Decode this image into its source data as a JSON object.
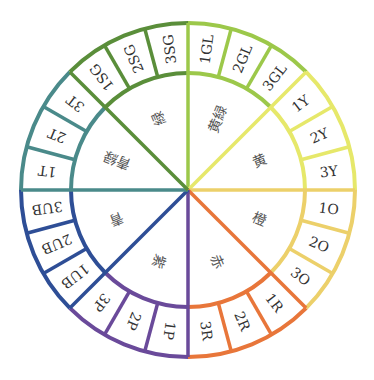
{
  "diagram": {
    "title": "",
    "center": [
      188,
      190
    ],
    "outer_radius": 167,
    "inner_radius": 117,
    "groups": [
      {
        "name": "黄緑",
        "color": "#9cc84a",
        "segments": [
          "1GL",
          "2GL",
          "3GL"
        ]
      },
      {
        "name": "黄",
        "color": "#e6e86a",
        "segments": [
          "1Y",
          "2Y",
          "3Y"
        ]
      },
      {
        "name": "橙",
        "color": "#ecd06a",
        "segments": [
          "1O",
          "2O",
          "3O"
        ]
      },
      {
        "name": "赤",
        "color": "#e8763a",
        "segments": [
          "1R",
          "2R",
          "3R"
        ]
      },
      {
        "name": "紫",
        "color": "#6a4a9a",
        "segments": [
          "1P",
          "2P",
          "3P"
        ]
      },
      {
        "name": "青",
        "color": "#2e4e96",
        "segments": [
          "1UB",
          "2UB",
          "3UB"
        ]
      },
      {
        "name": "青緑",
        "color": "#4a8a8a",
        "segments": [
          "1T",
          "2T",
          "3T"
        ]
      },
      {
        "name": "緑",
        "color": "#5a8e3a",
        "segments": [
          "1SG",
          "2SG",
          "3SG"
        ]
      }
    ]
  }
}
